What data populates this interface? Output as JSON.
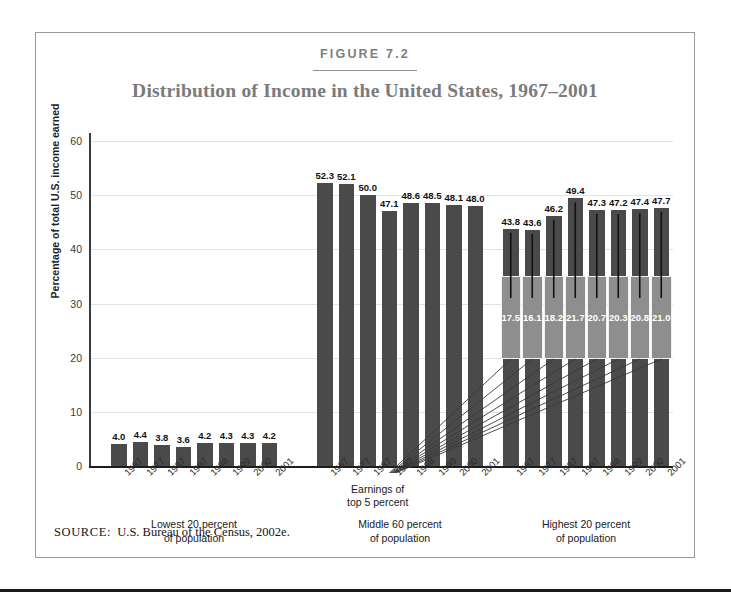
{
  "figure": {
    "number": "FIGURE 7.2",
    "title": "Distribution of Income in the United States, 1967–2001",
    "source_label": "SOURCE:",
    "source_text": "U.S. Bureau of the Census, 2002e."
  },
  "annotation": {
    "line1": "Earnings of",
    "line2": "top 5 percent"
  },
  "colors": {
    "bar": "#4a4a4a",
    "inset": "#8e8e8e",
    "grid": "#e2e2e2",
    "title": "#7b7b7b",
    "axis": "#1d1d1d"
  },
  "chart_data": {
    "type": "bar",
    "title": "Distribution of Income in the United States, 1967–2001",
    "xlabel": "",
    "ylabel": "Percentage of total U.S. income earned",
    "ylim": [
      0,
      60
    ],
    "yticks": [
      0,
      10,
      20,
      30,
      40,
      50,
      60
    ],
    "grid": true,
    "legend": "none",
    "categories": [
      "1967",
      "1977",
      "1987",
      "1997",
      "1998",
      "1999",
      "2000",
      "2001"
    ],
    "groups": [
      {
        "name": "Lowest 20 percent of population",
        "label_line1": "Lowest 20 percent",
        "label_line2": "of population",
        "values": [
          4.0,
          4.4,
          3.8,
          3.6,
          4.2,
          4.3,
          4.3,
          4.2
        ],
        "labels": [
          "4.0",
          "4.4",
          "3.8",
          "3.6",
          "4.2",
          "4.3",
          "4.3",
          "4.2"
        ]
      },
      {
        "name": "Middle 60 percent of population",
        "label_line1": "Middle 60 percent",
        "label_line2": "of population",
        "values": [
          52.3,
          52.1,
          50.0,
          47.1,
          48.6,
          48.5,
          48.1,
          48.0
        ],
        "labels": [
          "52.3",
          "52.1",
          "50.0",
          "47.1",
          "48.6",
          "48.5",
          "48.1",
          "48.0"
        ]
      },
      {
        "name": "Highest 20 percent of population",
        "label_line1": "Highest 20 percent",
        "label_line2": "of population",
        "values": [
          43.8,
          43.6,
          46.2,
          49.4,
          47.3,
          47.2,
          47.4,
          47.7
        ],
        "labels": [
          "43.8",
          "43.6",
          "46.2",
          "49.4",
          "47.3",
          "47.2",
          "47.4",
          "47.7"
        ],
        "inset_series_name": "Earnings of top 5 percent",
        "inset_values": [
          17.5,
          16.1,
          18.2,
          21.7,
          20.7,
          20.3,
          20.8,
          21.0
        ],
        "inset_labels": [
          "17.5",
          "16.1",
          "18.2",
          "21.7",
          "20.7",
          "20.3",
          "20.8",
          "21.0"
        ]
      }
    ]
  }
}
